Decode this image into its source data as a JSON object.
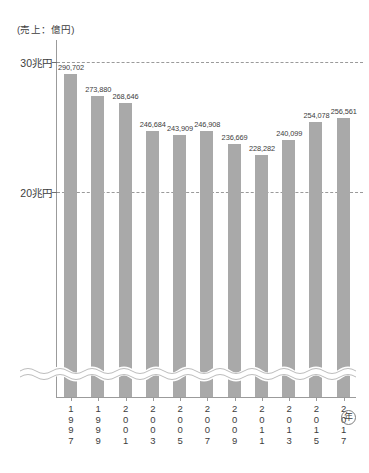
{
  "chart_data": {
    "type": "bar",
    "title": "",
    "unit_caption": "(売上：億円)",
    "xlabel": "年",
    "ylabel": "",
    "categories": [
      "1997",
      "1999",
      "2001",
      "2003",
      "2005",
      "2007",
      "2009",
      "2011",
      "2013",
      "2015",
      "2017"
    ],
    "values": [
      290702,
      273880,
      268646,
      246684,
      243909,
      246908,
      236669,
      228282,
      240099,
      254078,
      256561
    ],
    "value_labels": [
      "290,702",
      "273,880",
      "268,646",
      "246,684",
      "243,909",
      "246,908",
      "236,669",
      "228,282",
      "240,099",
      "254,078",
      "256,561"
    ],
    "y_ticks": [
      {
        "value": 300000,
        "label": "30兆円"
      },
      {
        "value": 200000,
        "label": "20兆円"
      }
    ],
    "ylim": [
      195000,
      305000
    ],
    "grid": true,
    "axis_break": true,
    "legend": "none",
    "bar_color": "#a9a9a9",
    "grid_color": "#9a9a9a",
    "axis_color": "#9b9b9b",
    "text_color": "#3d3d3d"
  }
}
